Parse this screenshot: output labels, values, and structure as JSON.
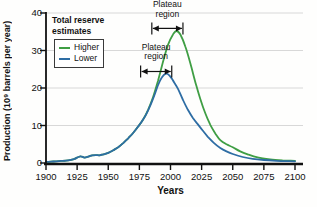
{
  "legend": {
    "title": "Total reserve estimates"
  },
  "chart_data": {
    "type": "line",
    "title": "",
    "xlabel": "Years",
    "ylabel": "Production (10⁹ barrels per year)",
    "xlim": [
      1900,
      2100
    ],
    "ylim": [
      0,
      40
    ],
    "x_ticks": [
      1900,
      1925,
      1950,
      1975,
      2000,
      2025,
      2050,
      2075,
      2100
    ],
    "y_ticks": [
      0,
      10,
      20,
      30,
      40
    ],
    "grid": "horizontal-light",
    "legend_position": "upper-left",
    "colors": {
      "axis": "#111111",
      "grid": "#d8d8d8"
    },
    "series": [
      {
        "name": "Higher",
        "color": "#3f9e44",
        "points": [
          [
            1900,
            0.3
          ],
          [
            1904,
            0.35
          ],
          [
            1908,
            0.45
          ],
          [
            1912,
            0.55
          ],
          [
            1916,
            0.65
          ],
          [
            1920,
            0.85
          ],
          [
            1923,
            1.1
          ],
          [
            1926,
            1.6
          ],
          [
            1928,
            1.8
          ],
          [
            1931,
            1.45
          ],
          [
            1934,
            1.7
          ],
          [
            1937,
            2.05
          ],
          [
            1940,
            2.1
          ],
          [
            1943,
            2.05
          ],
          [
            1946,
            2.3
          ],
          [
            1950,
            2.7
          ],
          [
            1954,
            3.4
          ],
          [
            1958,
            4.2
          ],
          [
            1962,
            5.3
          ],
          [
            1966,
            6.6
          ],
          [
            1970,
            8.0
          ],
          [
            1974,
            9.7
          ],
          [
            1978,
            11.6
          ],
          [
            1982,
            14.2
          ],
          [
            1986,
            17.6
          ],
          [
            1990,
            22.0
          ],
          [
            1994,
            27.0
          ],
          [
            1998,
            31.5
          ],
          [
            2002,
            34.3
          ],
          [
            2005,
            35.2
          ],
          [
            2008,
            34.2
          ],
          [
            2012,
            31.0
          ],
          [
            2016,
            26.5
          ],
          [
            2020,
            21.5
          ],
          [
            2024,
            17.0
          ],
          [
            2028,
            13.2
          ],
          [
            2032,
            10.2
          ],
          [
            2036,
            7.9
          ],
          [
            2040,
            6.1
          ],
          [
            2045,
            5.0
          ],
          [
            2050,
            4.2
          ],
          [
            2056,
            3.1
          ],
          [
            2062,
            2.3
          ],
          [
            2070,
            1.5
          ],
          [
            2080,
            1.0
          ],
          [
            2090,
            0.7
          ],
          [
            2100,
            0.6
          ]
        ]
      },
      {
        "name": "Lower",
        "color": "#2e6da4",
        "points": [
          [
            1900,
            0.3
          ],
          [
            1904,
            0.35
          ],
          [
            1908,
            0.45
          ],
          [
            1912,
            0.55
          ],
          [
            1916,
            0.65
          ],
          [
            1920,
            0.85
          ],
          [
            1923,
            1.1
          ],
          [
            1926,
            1.6
          ],
          [
            1928,
            1.8
          ],
          [
            1931,
            1.45
          ],
          [
            1934,
            1.7
          ],
          [
            1937,
            2.05
          ],
          [
            1940,
            2.1
          ],
          [
            1943,
            2.05
          ],
          [
            1946,
            2.3
          ],
          [
            1950,
            2.7
          ],
          [
            1954,
            3.4
          ],
          [
            1958,
            4.2
          ],
          [
            1962,
            5.3
          ],
          [
            1966,
            6.6
          ],
          [
            1970,
            8.0
          ],
          [
            1974,
            9.7
          ],
          [
            1978,
            11.6
          ],
          [
            1981,
            13.3
          ],
          [
            1984,
            15.5
          ],
          [
            1987,
            18.0
          ],
          [
            1990,
            20.8
          ],
          [
            1993,
            22.8
          ],
          [
            1996,
            23.8
          ],
          [
            1999,
            23.4
          ],
          [
            2002,
            22.0
          ],
          [
            2006,
            19.8
          ],
          [
            2010,
            16.8
          ],
          [
            2014,
            14.2
          ],
          [
            2018,
            12.0
          ],
          [
            2022,
            10.3
          ],
          [
            2026,
            8.6
          ],
          [
            2030,
            7.0
          ],
          [
            2035,
            5.3
          ],
          [
            2040,
            4.0
          ],
          [
            2045,
            3.1
          ],
          [
            2050,
            2.4
          ],
          [
            2058,
            1.6
          ],
          [
            2066,
            1.1
          ],
          [
            2075,
            0.8
          ],
          [
            2085,
            0.6
          ],
          [
            2100,
            0.45
          ]
        ]
      }
    ],
    "annotations": [
      {
        "label": "Plateau region",
        "series": "Higher",
        "x_start": 1985,
        "x_end": 2010,
        "y_level": 35.9
      },
      {
        "label": "Plateau region",
        "series": "Lower",
        "x_start": 1976,
        "x_end": 2001,
        "y_level": 24.4
      }
    ]
  }
}
